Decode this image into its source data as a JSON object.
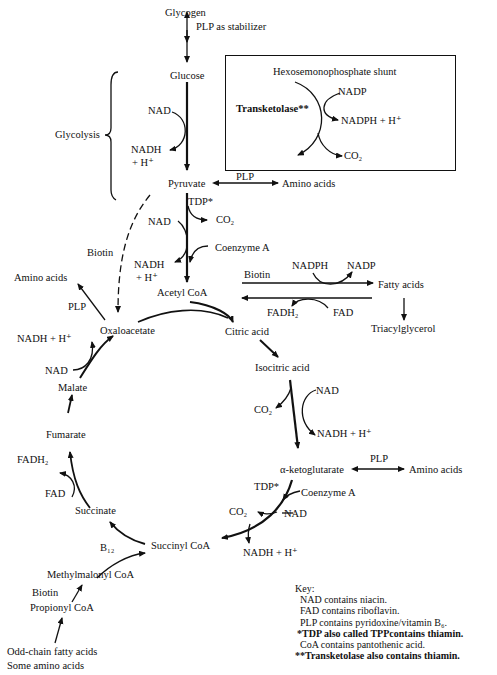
{
  "diagram": {
    "top": {
      "glycogen": "Glycogen",
      "plp_stabilizer": "PLP as stabilizer",
      "glucose": "Glucose",
      "glycolysis": "Glycolysis",
      "nad": "NAD",
      "nadh": "NADH",
      "h_plus": "+ H⁺"
    },
    "shunt": {
      "title": "Hexosemonophosphate shunt",
      "enzyme": "Transketolase**",
      "nadp": "NADP",
      "nadph": "NADPH + H⁺",
      "co2": "CO₂"
    },
    "pyruvate": {
      "label": "Pyruvate",
      "plp": "PLP",
      "amino_acids": "Amino acids",
      "tdp": "TDP*",
      "co2": "CO₂",
      "nad": "NAD",
      "coenzyme_a": "Coenzyme A",
      "nadh": "NADH",
      "h_plus": "+ H⁺",
      "biotin": "Biotin"
    },
    "acetyl_coa": "Acetyl CoA",
    "fatty": {
      "nadph": "NADPH",
      "nadp": "NADP",
      "biotin": "Biotin",
      "fatty_acids": "Fatty acids",
      "fadh2": "FADH₂",
      "fad": "FAD",
      "triacylglycerol": "Triacylglycerol"
    },
    "cycle": {
      "amino_acids_left": "Amino acids",
      "plp_left": "PLP",
      "oxaloacetate": "Oxaloacetate",
      "nadh_h_left": "NADH + H⁺",
      "nad_left": "NAD",
      "malate": "Malate",
      "fumarate": "Fumarate",
      "fadh2": "FADH₂",
      "fad": "FAD",
      "succinate": "Succinate",
      "citric_acid": "Citric acid",
      "isocitric_acid": "Isocitric acid",
      "co2_iso": "CO₂",
      "nad_iso": "NAD",
      "nadh_iso": "NADH + H⁺",
      "akg": "α-ketoglutarate",
      "plp_akg": "PLP",
      "amino_acids_akg": "Amino acids",
      "tdp_akg": "TDP*",
      "coa_akg": "Coenzyme A",
      "co2_akg": "CO₂",
      "nad_akg": "NAD",
      "nadh_akg": "NADH + H⁺",
      "succinyl_coa": "Succinyl CoA"
    },
    "odd_chain": {
      "b12": "B₁₂",
      "methylmalonyl_coa": "Methylmalonyl CoA",
      "biotin": "Biotin",
      "propionyl_coa": "Propionyl CoA",
      "odd_chain_fa": "Odd-chain fatty acids",
      "some_amino_acids": "Some amino acids"
    },
    "key": {
      "title": "Key:",
      "lines": [
        "NAD contains niacin.",
        "FAD contains riboflavin.",
        "PLP contains pyridoxine/vitamin B₆.",
        "*TDP also called TPPcontains thiamin.",
        "CoA contains pantothenic acid.",
        "**Transketolase also contains thiamin."
      ]
    }
  }
}
